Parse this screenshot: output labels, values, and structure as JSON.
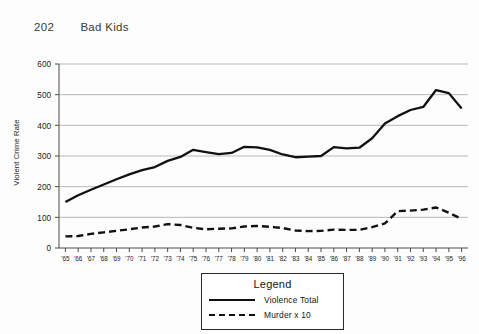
{
  "page_header": {
    "folio": "202",
    "running_title": "Bad Kids"
  },
  "legend": {
    "title": "Legend",
    "entries": [
      {
        "label": "Violence Total",
        "style": "solid"
      },
      {
        "label": "Murder x 10",
        "style": "dashed"
      }
    ]
  },
  "chart_data": {
    "type": "line",
    "title": "",
    "xlabel": "",
    "ylabel": "Violent Crime Rate",
    "ylim": [
      0,
      600
    ],
    "ytick_labels": [
      "0",
      "100",
      "200",
      "300",
      "400",
      "500",
      "600"
    ],
    "yticks": [
      0,
      100,
      200,
      300,
      400,
      500,
      600
    ],
    "grid": "horizontal",
    "legend_position": "below-center",
    "categories": [
      "'65",
      "'66",
      "'67",
      "'68",
      "'69",
      "'70",
      "'71",
      "'72",
      "'73",
      "'74",
      "'75",
      "'76",
      "'77",
      "'78",
      "'79",
      "'80",
      "'81",
      "'82",
      "'83",
      "'84",
      "'85",
      "'86",
      "'87",
      "'88",
      "'89",
      "'90",
      "'91",
      "'92",
      "'93",
      "'94",
      "'95",
      "'96"
    ],
    "series": [
      {
        "name": "Violence Total",
        "style": "solid",
        "color": "#111111",
        "values": [
          150,
          172,
          190,
          207,
          224,
          240,
          254,
          264,
          284,
          297,
          320,
          313,
          306,
          310,
          330,
          328,
          320,
          305,
          296,
          298,
          300,
          329,
          325,
          327,
          358,
          406,
          430,
          450,
          460,
          515,
          505,
          455
        ]
      },
      {
        "name": "Murder x 10",
        "style": "dashed",
        "color": "#111111",
        "values": [
          38,
          39,
          46,
          51,
          56,
          61,
          67,
          70,
          78,
          75,
          66,
          61,
          63,
          64,
          70,
          72,
          69,
          65,
          57,
          55,
          56,
          60,
          59,
          59,
          68,
          80,
          120,
          122,
          125,
          132,
          115,
          95
        ]
      }
    ]
  }
}
